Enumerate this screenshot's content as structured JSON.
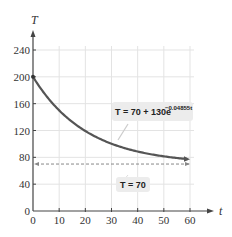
{
  "chart_data": {
    "type": "line",
    "title": "",
    "xlabel": "t",
    "ylabel": "T",
    "xlim": [
      0,
      60
    ],
    "ylim": [
      0,
      240
    ],
    "grid": true,
    "x_ticks": [
      0,
      10,
      20,
      30,
      40,
      50,
      60
    ],
    "y_ticks": [
      0,
      40,
      80,
      120,
      160,
      200,
      240
    ],
    "x_tick_labels": [
      "0",
      "10",
      "20",
      "30",
      "40",
      "50",
      "60"
    ],
    "y_tick_labels": [
      "0",
      "40",
      "80",
      "120",
      "160",
      "200",
      "240"
    ],
    "series": [
      {
        "name": "T = 70 + 130e^(-0.04855t)",
        "style": "solid",
        "color": "#555555",
        "x": [
          0,
          5,
          10,
          15,
          20,
          25,
          30,
          35,
          40,
          45,
          50,
          55,
          60
        ],
        "values": [
          200,
          172.2,
          150.2,
          132.7,
          118.8,
          107.7,
          99.0,
          92.0,
          86.5,
          82.1,
          78.6,
          75.9,
          73.8
        ]
      },
      {
        "name": "T = 70",
        "style": "dashed",
        "color": "#888888",
        "x": [
          0,
          60
        ],
        "values": [
          70,
          70
        ]
      }
    ],
    "annotations": [
      {
        "text_main": "T = 70 + 130e",
        "text_exp": "−0.04855t",
        "points_to": "curve"
      },
      {
        "text_main": "T = 70",
        "points_to": "asymptote"
      }
    ],
    "legend": "none"
  }
}
